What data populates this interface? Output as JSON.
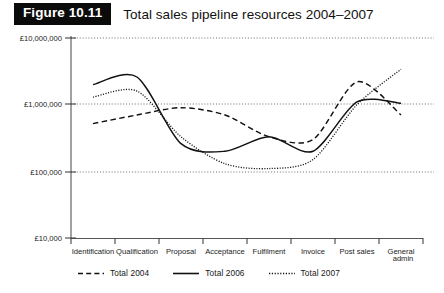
{
  "figure": {
    "badge_label": "Figure 10.11",
    "caption": "Total sales pipeline resources 2004–2007"
  },
  "chart_data": {
    "type": "line",
    "title": "Total sales pipeline resources 2004–2007",
    "xlabel": "",
    "ylabel": "",
    "yscale": "log",
    "ylim": [
      10000,
      10000000
    ],
    "ytick_labels": [
      "£10,000,000",
      "£1,000,000",
      "£100,000",
      "£10,000"
    ],
    "ytick_values": [
      10000000,
      1000000,
      100000,
      10000
    ],
    "grid": "horizontal dotted gridlines at each decade",
    "legend_position": "below plot, left aligned",
    "categories": [
      "Identification",
      "Qualification",
      "Proposal",
      "Acceptance",
      "Fulfilment",
      "Invoice",
      "Post sales",
      "General admin"
    ],
    "series": [
      {
        "name": "Total  2004",
        "style": "dashed",
        "color": "#111111",
        "values": [
          520000,
          700000,
          900000,
          700000,
          330000,
          300000,
          2200000,
          700000
        ]
      },
      {
        "name": "Total 2006",
        "style": "solid",
        "color": "#111111",
        "values": [
          2000000,
          2600000,
          260000,
          200000,
          330000,
          200000,
          1100000,
          1050000
        ]
      },
      {
        "name": "Total 2007",
        "style": "dotted",
        "color": "#111111",
        "values": [
          1300000,
          1600000,
          330000,
          130000,
          110000,
          150000,
          1000000,
          3400000
        ]
      }
    ]
  },
  "legend": {
    "items": [
      {
        "label": "Total  2004",
        "style": "dashed"
      },
      {
        "label": "Total 2006",
        "style": "solid"
      },
      {
        "label": "Total 2007",
        "style": "dotted"
      }
    ]
  },
  "axis": {
    "y_ticks": [
      {
        "label": "£10,000,000"
      },
      {
        "label": "£1,000,000"
      },
      {
        "label": "£100,000"
      },
      {
        "label": "£10,000"
      }
    ],
    "x_ticks": [
      {
        "label": "Identification"
      },
      {
        "label": "Qualification"
      },
      {
        "label": "Proposal"
      },
      {
        "label": "Acceptance"
      },
      {
        "label": "Fulfilment"
      },
      {
        "label": "Invoice"
      },
      {
        "label": "Post sales"
      },
      {
        "label": "General"
      },
      {
        "label": "admin"
      }
    ]
  }
}
